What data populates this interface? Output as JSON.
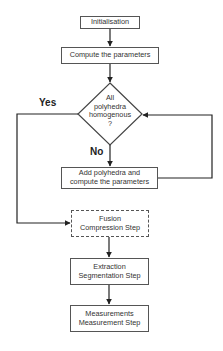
{
  "flowchart": {
    "nodes": {
      "init": {
        "label": "Initialisation"
      },
      "compute": {
        "label": "Compute the parameters"
      },
      "decision": {
        "line1": "All",
        "line2": "polyhedra",
        "line3": "homogenous",
        "line4": "?"
      },
      "add": {
        "line1": "Add polyhedra and",
        "line2": "compute the parameters"
      },
      "fusion": {
        "line1": "Fusion",
        "line2": "Compression Step"
      },
      "extraction": {
        "line1": "Extraction",
        "line2": "Segmentation Step"
      },
      "measurements": {
        "line1": "Measurements",
        "line2": "Measurement  Step"
      }
    },
    "edges": {
      "yes_label": "Yes",
      "no_label": "No"
    },
    "colors": {
      "line": "#222222",
      "box_border": "#555555",
      "background": "#ffffff"
    }
  }
}
